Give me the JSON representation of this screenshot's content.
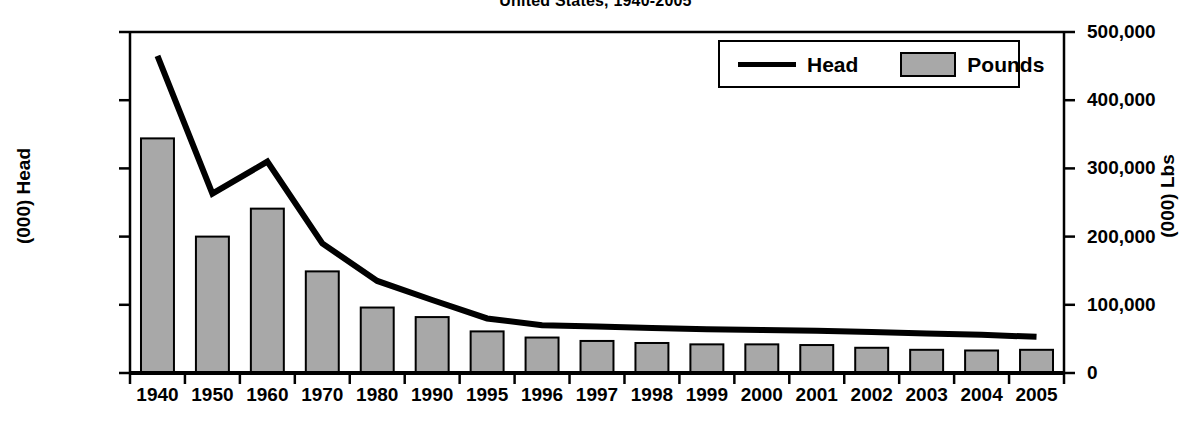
{
  "chart_data": {
    "type": "bar",
    "title": "United States, 1940-2005",
    "xlabel": "",
    "ylabel": "(000) Head",
    "y2label": "(000) Lbs",
    "categories": [
      "1940",
      "1950",
      "1960",
      "1970",
      "1980",
      "1990",
      "1995",
      "1996",
      "1997",
      "1998",
      "1999",
      "2000",
      "2001",
      "2002",
      "2003",
      "2004",
      "2005"
    ],
    "ylim": [
      0,
      50000
    ],
    "y2lim": [
      0,
      500000
    ],
    "yticks": [
      "0",
      "10,000",
      "20,000",
      "30,000",
      "40,000",
      "50,000"
    ],
    "ytick_values": [
      0,
      10000,
      20000,
      30000,
      40000,
      50000
    ],
    "y2ticks": [
      "0",
      "100,000",
      "200,000",
      "300,000",
      "400,000",
      "500,000"
    ],
    "y2tick_values": [
      0,
      100000,
      200000,
      300000,
      400000,
      500000
    ],
    "grid": false,
    "legend_position": "top-right",
    "series": [
      {
        "name": "Pounds",
        "type": "bar",
        "axis": "right",
        "color": "#a8a8a8",
        "edge_color": "#000000",
        "values": [
          344000,
          200000,
          241000,
          149000,
          96000,
          82000,
          61000,
          52000,
          47000,
          44000,
          42000,
          42000,
          41000,
          37000,
          34000,
          33000,
          34000
        ]
      },
      {
        "name": "Head",
        "type": "line",
        "axis": "left",
        "color": "#000000",
        "values": [
          46500,
          26300,
          31000,
          19000,
          13500,
          10700,
          8000,
          7000,
          6800,
          6600,
          6400,
          6300,
          6200,
          6000,
          5800,
          5600,
          5300
        ]
      }
    ]
  },
  "legend": {
    "items": [
      {
        "label": "Head",
        "marker": "line"
      },
      {
        "label": "Pounds",
        "marker": "rect"
      }
    ]
  }
}
